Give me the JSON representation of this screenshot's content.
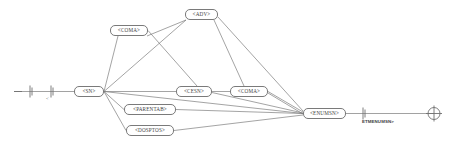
{
  "diagram": {
    "type": "syntax-network-graph",
    "title": "",
    "canvas": {
      "width": 460,
      "height": 148
    },
    "colors": {
      "background": "#ffffff",
      "edge": "#7d7d7d",
      "node_border": "#7a7a7a",
      "node_fill": "#ffffff",
      "text": "#444444",
      "label_text": "#3d3d3d"
    },
    "start_marker": {
      "name": "entry-terminator",
      "glyph": "bar-bar",
      "label": "<"
    },
    "end_marker": {
      "name": "exit-terminator",
      "glyph": "circle-plus"
    },
    "nodes": [
      {
        "id": "sn",
        "label": "<SN>",
        "x": 74,
        "y": 86,
        "w": 30,
        "h": 11
      },
      {
        "id": "coma1",
        "label": "<COMA>",
        "x": 110,
        "y": 25,
        "w": 38,
        "h": 11
      },
      {
        "id": "adv",
        "label": "<ADV>",
        "x": 185,
        "y": 9,
        "w": 33,
        "h": 11
      },
      {
        "id": "cesn",
        "label": "<CESN>",
        "x": 176,
        "y": 86,
        "w": 36,
        "h": 11
      },
      {
        "id": "coma2",
        "label": "<COMA>",
        "x": 230,
        "y": 86,
        "w": 38,
        "h": 11
      },
      {
        "id": "parentab",
        "label": "<PARENTAB>",
        "x": 124,
        "y": 104,
        "w": 52,
        "h": 11
      },
      {
        "id": "dosptos",
        "label": "<DOSPTOS>",
        "x": 126,
        "y": 125,
        "w": 48,
        "h": 11
      },
      {
        "id": "enumsn",
        "label": "<ENUMSN>",
        "x": 303,
        "y": 108,
        "w": 43,
        "h": 11
      }
    ],
    "edge_labels": [
      {
        "id": "etmenumsn",
        "text": "ETMENUMSN>",
        "x": 362,
        "y": 120
      }
    ],
    "edges": [
      {
        "from": "start",
        "to": "sn"
      },
      {
        "from": "sn",
        "to": "coma1"
      },
      {
        "from": "sn",
        "to": "adv"
      },
      {
        "from": "sn",
        "to": "cesn"
      },
      {
        "from": "sn",
        "to": "parentab"
      },
      {
        "from": "sn",
        "to": "dosptos"
      },
      {
        "from": "sn",
        "to": "enumsn"
      },
      {
        "from": "coma1",
        "to": "cesn"
      },
      {
        "from": "adv",
        "to": "coma2"
      },
      {
        "from": "adv",
        "to": "enumsn"
      },
      {
        "from": "cesn",
        "to": "coma2"
      },
      {
        "from": "cesn",
        "to": "enumsn"
      },
      {
        "from": "coma2",
        "to": "enumsn"
      },
      {
        "from": "parentab",
        "to": "enumsn"
      },
      {
        "from": "dosptos",
        "to": "enumsn"
      },
      {
        "from": "enumsn",
        "to": "end"
      }
    ]
  }
}
